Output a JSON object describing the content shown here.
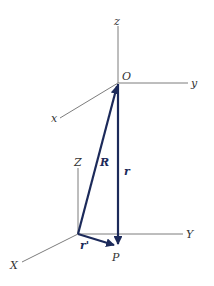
{
  "diagram": {
    "type": "vector-position-diagram",
    "frames": [
      {
        "name": "primed-frame",
        "origin_label": "O",
        "axes": {
          "x": "x",
          "y": "y",
          "z": "z"
        }
      },
      {
        "name": "fixed-frame",
        "axes": {
          "x": "X",
          "y": "Y",
          "z": "Z"
        }
      }
    ],
    "vectors": [
      {
        "label": "R",
        "from": "fixed-origin",
        "to": "O"
      },
      {
        "label": "r",
        "from": "O",
        "to": "P"
      },
      {
        "label": "r'",
        "from": "fixed-origin",
        "to": "P"
      }
    ],
    "point_label": "P",
    "colors": {
      "vector": "#1c2a5a",
      "axis": "#5a5a5a"
    }
  }
}
